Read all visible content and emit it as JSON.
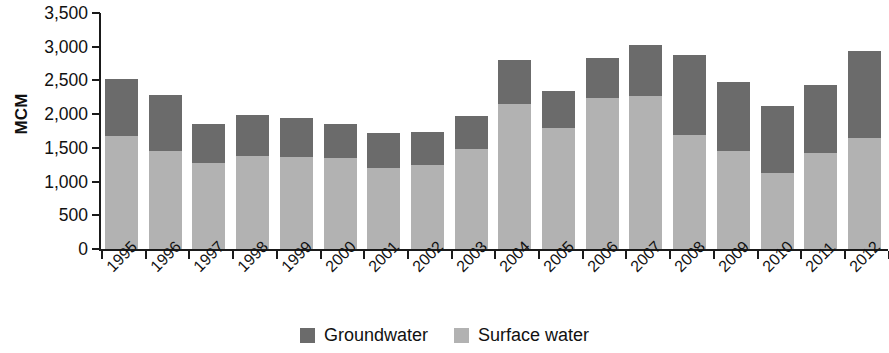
{
  "chart_data": {
    "type": "bar",
    "subtype": "stacked-vertical",
    "title": "",
    "xlabel": "",
    "ylabel": "MCM",
    "ylim": [
      0,
      3500
    ],
    "ytick_step": 500,
    "ytick_labels": [
      "3,500",
      "3,000",
      "2,500",
      "2,000",
      "1,500",
      "1,000",
      "500",
      "0"
    ],
    "ytick_values": [
      3500,
      3000,
      2500,
      2000,
      1500,
      1000,
      500,
      0
    ],
    "grid": false,
    "legend_position": "bottom-center",
    "categories": [
      "1995",
      "1996",
      "1997",
      "1998",
      "1999",
      "2000",
      "2001",
      "2002",
      "2003",
      "2004",
      "2005",
      "2006",
      "2007",
      "2008",
      "2009",
      "2010",
      "2011",
      "2012"
    ],
    "series": [
      {
        "name": "Surface water",
        "color": "#b2b2b2",
        "values": [
          1680,
          1450,
          1270,
          1380,
          1370,
          1350,
          1200,
          1250,
          1480,
          2150,
          1790,
          2240,
          2270,
          1690,
          1450,
          1120,
          1420,
          1640
        ]
      },
      {
        "name": "Groundwater",
        "color": "#6b6b6b",
        "values": [
          840,
          830,
          580,
          610,
          580,
          510,
          520,
          490,
          500,
          650,
          550,
          590,
          760,
          1180,
          1020,
          1000,
          1020,
          1300
        ]
      }
    ],
    "totals": [
      2520,
      2280,
      1850,
      1990,
      1950,
      1860,
      1720,
      1740,
      1980,
      2800,
      2340,
      2830,
      3030,
      2870,
      2470,
      2120,
      2440,
      2940
    ]
  },
  "legend": {
    "items": [
      {
        "label": "Groundwater",
        "color": "#6b6b6b"
      },
      {
        "label": "Surface water",
        "color": "#b2b2b2"
      }
    ]
  },
  "axes": {
    "y_title": "MCM"
  }
}
